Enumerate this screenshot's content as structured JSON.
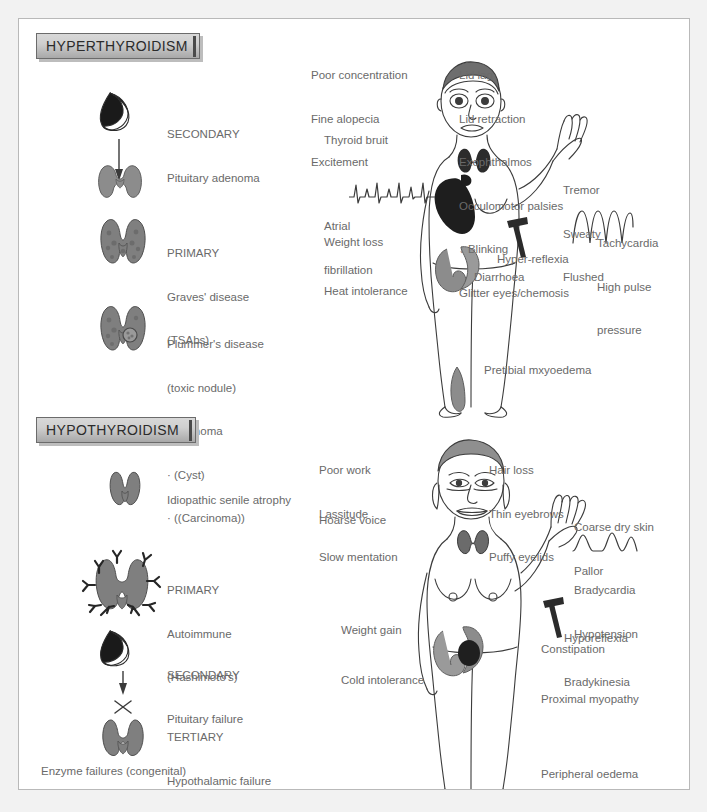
{
  "document": {
    "title": "Thyroid disease: hyperthyroidism and hypothyroidism clinical features"
  },
  "sections": {
    "hyper": {
      "badge": "HYPERTHYROIDISM",
      "causes": [
        {
          "id": "secondary",
          "lines": [
            "SECONDARY",
            "Pituitary adenoma"
          ],
          "icon": "pituitary-adenoma-icon"
        },
        {
          "id": "primary",
          "lines": [
            "PRIMARY",
            "Graves' disease",
            "(TSAbs)"
          ],
          "icon": "thyroid-gland-icon"
        },
        {
          "id": "plummer",
          "lines": [
            "Plummer's disease",
            "(toxic nodule)",
            "· Adenoma",
            "· (Cyst)",
            "· ((Carcinoma))"
          ],
          "icon": "thyroid-nodule-icon"
        }
      ],
      "symptoms_left": [
        "Poor concentration",
        "Fine alopecia",
        "Excitement"
      ],
      "symptoms_right": [
        "Lid lag",
        "Lid retraction",
        "Exophthalmos",
        "Occulomotor palsies",
        "↓ Blinking",
        "Glitter eyes/chemosis"
      ],
      "thyroid_bruit": "Thyroid bruit",
      "atrial_fibrillation": [
        "Atrial",
        "fibrillation"
      ],
      "weight_loss": "Weight loss",
      "heat_intolerance": "Heat intolerance",
      "pretibial": "Pretibial mxyoedema",
      "hand_signs": [
        "Tremor",
        "Sweaty",
        "Flushed"
      ],
      "pulse_signs": [
        "Tachycardia",
        "High pulse",
        "pressure"
      ],
      "hyper_reflexia": "Hyper-reflexia",
      "diarrhoea": "Diarrhoea"
    },
    "hypo": {
      "badge": "HYPOTHYROIDISM",
      "causes": [
        {
          "id": "idiopathic",
          "lines": [
            "Idiopathic senile atrophy"
          ],
          "icon": "atrophic-thyroid-icon"
        },
        {
          "id": "autoimmune",
          "lines": [
            "PRIMARY",
            "Autoimmune",
            "(Hashimoto's)"
          ],
          "icon": "thyroid-antibodies-icon"
        },
        {
          "id": "pituitary",
          "lines": [
            "SECONDARY",
            "Pituitary failure"
          ],
          "icon": "pituitary-failure-icon"
        },
        {
          "id": "hypothalamic",
          "lines": [
            "TERTIARY",
            "Hypothalamic failure"
          ],
          "icon": "blocked-thyroid-icon"
        }
      ],
      "footnote": "Enzyme failures (congenital)",
      "symptoms_left": [
        "Poor work",
        "Lassitude",
        "Slow mentation"
      ],
      "symptoms_right": [
        "Hair loss",
        "Thin eyebrows",
        "Puffy eyelids"
      ],
      "hoarse_voice": "Hoarse voice",
      "skin_signs": [
        "Coarse dry skin",
        "Pallor"
      ],
      "pulse_signs": [
        "Bradycardia",
        "Hypotension"
      ],
      "reflex_signs": [
        "Hyporeflexia",
        "Bradykinesia"
      ],
      "weight_gain": "Weight gain",
      "cold_intolerance": "Cold intolerance",
      "constipation": "Constipation",
      "proximal_myopathy": "Proximal myopathy",
      "peripheral_oedema": "Peripheral oedema"
    }
  },
  "colors": {
    "page_background": "#f2f2f2",
    "panel_background": "#ffffff",
    "panel_border": "#b9b9b9",
    "text": "#6a6a6a",
    "badge_text": "#2b2b2b",
    "organ_gray": "#8c8c8c",
    "organ_dark": "#2f2f2f",
    "line": "#4a4a4a"
  }
}
